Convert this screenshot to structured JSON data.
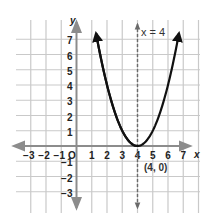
{
  "chart_data": {
    "type": "line",
    "title": "",
    "xlabel": "x",
    "ylabel": "y",
    "xlim": [
      -3,
      7
    ],
    "ylim": [
      -3,
      7
    ],
    "grid": true,
    "x_ticks": [
      "-3",
      "-2",
      "-1",
      "1",
      "2",
      "3",
      "4",
      "5",
      "6",
      "7"
    ],
    "y_ticks": [
      "7",
      "6",
      "5",
      "4",
      "3",
      "2",
      "1",
      "-1",
      "-2",
      "-3"
    ],
    "origin_label": "O",
    "series": [
      {
        "name": "y = (x - 4)^2",
        "equation": "y = (x - 4)^2",
        "color": "#111111",
        "x": [
          1.35,
          2,
          3,
          4,
          5,
          6,
          6.65
        ],
        "y": [
          7,
          4,
          1,
          0,
          1,
          4,
          7
        ]
      }
    ],
    "axis_of_symmetry": {
      "label": "x = 4",
      "x": 4,
      "style": "dashed",
      "color": "#555555"
    },
    "annotations": [
      {
        "text": "(4, 0)",
        "x": 4,
        "y": 0,
        "role": "vertex"
      },
      {
        "text": "x = 4",
        "x": 4,
        "y": 7,
        "role": "symmetry-line-label"
      }
    ]
  },
  "labels": {
    "x_axis": "x",
    "y_axis": "y",
    "origin": "O",
    "vertex": "(4, 0)",
    "symmetry": "x = 4"
  },
  "colors": {
    "grid": "#c9c9c9",
    "axis": "#8c8c8c",
    "curve": "#111111",
    "symmetry": "#6a6a6a"
  }
}
